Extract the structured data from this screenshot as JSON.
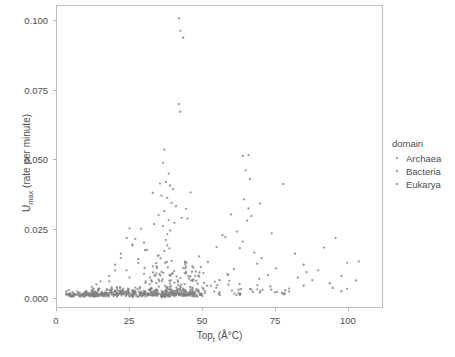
{
  "chart_data": {
    "type": "scatter",
    "title": "",
    "xlabel": "Top",
    "xlabel_sub": "t",
    "xlabel_unit": " (Å°C)",
    "xlabel_full": "Topt (Å°C)",
    "ylabel": "U",
    "ylabel_sub": "max",
    "ylabel_unit": " (rate per minute)",
    "ylabel_full": "Umax (rate per minute)",
    "xlim": [
      0.0,
      112.0
    ],
    "ylim": [
      -0.0035,
      0.1055
    ],
    "xticks": [
      0,
      25,
      50,
      75,
      100
    ],
    "xtick_labels": [
      "0",
      "25",
      "50",
      "75",
      "100"
    ],
    "yticks": [
      0.0,
      0.025,
      0.05,
      0.075,
      0.1
    ],
    "ytick_labels": [
      "0.000",
      "0.025",
      "0.050",
      "0.075",
      "0.100"
    ],
    "grid": false,
    "legend_position": "right",
    "legend_title": "domain",
    "marker_color": "#808080",
    "marker_size": 2.3,
    "panel_border_color": "#bfbfbf",
    "axis_text_color": "#4d4d4d",
    "series": [
      {
        "name": "Archaea",
        "color": "#808080",
        "points": [
          [
            80.0,
            0.0021
          ],
          [
            85.0,
            0.0042
          ],
          [
            98.0,
            0.0022
          ],
          [
            100.0,
            0.0031
          ],
          [
            85.0,
            0.0118
          ],
          [
            88.0,
            0.0062
          ],
          [
            75.0,
            0.0018
          ],
          [
            98.0,
            0.0078
          ],
          [
            103.0,
            0.0061
          ],
          [
            95.0,
            0.0034
          ],
          [
            83.0,
            0.0071
          ],
          [
            90.0,
            0.0098
          ],
          [
            100.0,
            0.0125
          ],
          [
            96.0,
            0.0215
          ],
          [
            92.0,
            0.018
          ],
          [
            78.0,
            0.041
          ],
          [
            104.0,
            0.013
          ],
          [
            86.0,
            0.0091
          ],
          [
            94.0,
            0.0051
          ],
          [
            82.0,
            0.0158
          ]
        ]
      },
      {
        "name": "Bacteria",
        "color": "#808080",
        "points": [
          [
            42.0,
            0.101
          ],
          [
            42.5,
            0.0965
          ],
          [
            43.5,
            0.094
          ],
          [
            42.0,
            0.07
          ],
          [
            42.5,
            0.0672
          ],
          [
            37.0,
            0.0535
          ],
          [
            64.0,
            0.0512
          ],
          [
            66.0,
            0.0516
          ],
          [
            36.5,
            0.0487
          ],
          [
            65.0,
            0.046
          ],
          [
            38.5,
            0.0448
          ],
          [
            66.5,
            0.0428
          ],
          [
            35.5,
            0.0412
          ],
          [
            37.5,
            0.0418
          ],
          [
            39.0,
            0.0405
          ],
          [
            40.0,
            0.0392
          ],
          [
            46.0,
            0.038
          ],
          [
            33.0,
            0.0378
          ],
          [
            36.0,
            0.0368
          ],
          [
            38.0,
            0.036
          ],
          [
            64.5,
            0.0355
          ],
          [
            70.0,
            0.034
          ],
          [
            39.5,
            0.0342
          ],
          [
            41.0,
            0.033
          ],
          [
            66.0,
            0.0322
          ],
          [
            44.5,
            0.032
          ],
          [
            37.0,
            0.0312
          ],
          [
            60.0,
            0.03
          ],
          [
            35.0,
            0.0298
          ],
          [
            67.0,
            0.0295
          ],
          [
            43.0,
            0.0288
          ],
          [
            45.0,
            0.0285
          ],
          [
            38.5,
            0.028
          ],
          [
            65.5,
            0.0278
          ],
          [
            40.5,
            0.027
          ],
          [
            33.5,
            0.0265
          ],
          [
            36.5,
            0.0258
          ],
          [
            25.0,
            0.025
          ],
          [
            29.0,
            0.0248
          ],
          [
            39.0,
            0.0242
          ],
          [
            62.0,
            0.0238
          ],
          [
            74.0,
            0.0232
          ],
          [
            38.0,
            0.0228
          ],
          [
            57.0,
            0.0225
          ],
          [
            58.0,
            0.0218
          ],
          [
            27.0,
            0.0212
          ],
          [
            37.5,
            0.0208
          ],
          [
            64.0,
            0.0202
          ],
          [
            30.0,
            0.0198
          ],
          [
            26.0,
            0.0192
          ],
          [
            38.0,
            0.0188
          ],
          [
            55.0,
            0.0182
          ],
          [
            63.0,
            0.0178
          ],
          [
            31.0,
            0.0172
          ],
          [
            37.0,
            0.0168
          ],
          [
            68.0,
            0.0162
          ],
          [
            22.0,
            0.0158
          ],
          [
            35.0,
            0.0152
          ],
          [
            49.0,
            0.0148
          ],
          [
            70.5,
            0.0142
          ],
          [
            28.0,
            0.0138
          ],
          [
            39.5,
            0.0132
          ],
          [
            52.0,
            0.0128
          ],
          [
            69.0,
            0.0122
          ],
          [
            20.0,
            0.0118
          ],
          [
            33.0,
            0.0112
          ],
          [
            47.0,
            0.0108
          ],
          [
            61.0,
            0.0102
          ],
          [
            24.0,
            0.0098
          ],
          [
            36.0,
            0.0092
          ],
          [
            50.5,
            0.0088
          ],
          [
            59.0,
            0.0082
          ],
          [
            18.0,
            0.0078
          ],
          [
            32.0,
            0.0072
          ],
          [
            45.5,
            0.0068
          ],
          [
            56.0,
            0.0062
          ],
          [
            15.0,
            0.0058
          ],
          [
            30.5,
            0.0052
          ],
          [
            44.0,
            0.0048
          ],
          [
            53.0,
            0.0042
          ],
          [
            12.0,
            0.0038
          ],
          [
            28.5,
            0.0032
          ],
          [
            42.0,
            0.0028
          ],
          [
            51.0,
            0.0022
          ],
          [
            10.0,
            0.0018
          ],
          [
            26.5,
            0.0012
          ],
          [
            40.0,
            0.0008
          ],
          [
            48.0,
            0.0005
          ]
        ]
      },
      {
        "name": "Eukarya",
        "color": "#808080",
        "points": [
          [
            24.0,
            0.0215
          ],
          [
            26.0,
            0.0188
          ],
          [
            22.0,
            0.0142
          ],
          [
            28.0,
            0.0125
          ],
          [
            20.0,
            0.0098
          ],
          [
            30.0,
            0.0085
          ],
          [
            25.0,
            0.0072
          ],
          [
            18.0,
            0.0058
          ],
          [
            32.0,
            0.0048
          ],
          [
            27.0,
            0.0035
          ],
          [
            21.0,
            0.0025
          ],
          [
            29.0,
            0.0015
          ]
        ]
      }
    ],
    "n_points_total": 760
  },
  "legend": {
    "title": "domain",
    "items": [
      {
        "label": "Archaea"
      },
      {
        "label": "Bacteria"
      },
      {
        "label": "Eukarya"
      }
    ]
  }
}
